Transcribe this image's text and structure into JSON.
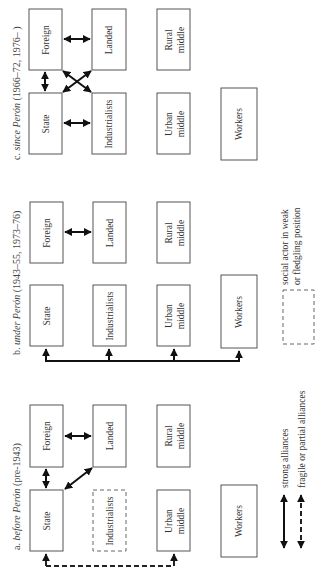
{
  "figure": {
    "orientation": "rotated 90° counter-clockwise",
    "panels": [
      {
        "id": "a",
        "title_prefix": "a.",
        "title_italic": "before Perón",
        "title_rest": "(pre-1943)",
        "actors": {
          "foreign": "Foreign",
          "landed": "Landed",
          "rural": "Rural middle",
          "state": "State",
          "industrialists": "Industrialists",
          "urban": "Urban middle",
          "workers": "Workers"
        },
        "weak_actors": [
          "Industrialists"
        ],
        "alliances": [
          {
            "from": "State",
            "to": "Foreign",
            "type": "strong"
          },
          {
            "from": "Foreign",
            "to": "Landed",
            "type": "strong"
          },
          {
            "from": "State",
            "to": "Landed",
            "type": "strong"
          },
          {
            "from": "State",
            "to": "Urban middle",
            "type": "fragile"
          }
        ]
      },
      {
        "id": "b",
        "title_prefix": "b.",
        "title_italic": "under Perón",
        "title_rest": "(1943–55, 1973–76)",
        "actors": {
          "foreign": "Foreign",
          "landed": "Landed",
          "rural": "Rural middle",
          "state": "State",
          "industrialists": "Industrialists",
          "urban": "Urban middle",
          "workers": "Workers"
        },
        "weak_actors": [],
        "alliances": [
          {
            "from": "Foreign",
            "to": "Landed",
            "type": "strong"
          },
          {
            "from": "State",
            "to": "Industrialists, Urban middle, Workers",
            "type": "strong"
          }
        ]
      },
      {
        "id": "c",
        "title_prefix": "c.",
        "title_italic": "since Perón",
        "title_rest": "(1966–72, 1976–   )",
        "actors": {
          "foreign": "Foreign",
          "landed": "Landed",
          "rural": "Rural middle",
          "state": "State",
          "industrialists": "Industrialists",
          "urban": "Urban middle",
          "workers": "Workers"
        },
        "weak_actors": [],
        "alliances": [
          {
            "from": "Foreign",
            "to": "Landed",
            "type": "strong"
          },
          {
            "from": "State",
            "to": "Foreign",
            "type": "strong"
          },
          {
            "from": "State",
            "to": "Industrialists",
            "type": "strong"
          },
          {
            "from": "Foreign",
            "to": "Industrialists",
            "type": "strong"
          },
          {
            "from": "State",
            "to": "Landed",
            "type": "strong"
          }
        ]
      }
    ],
    "legend": {
      "strong": "strong alliances",
      "fragile": "fragile or partial alliances",
      "weak_line1": "social actor in weak",
      "weak_line2": "or fledgling position"
    }
  }
}
